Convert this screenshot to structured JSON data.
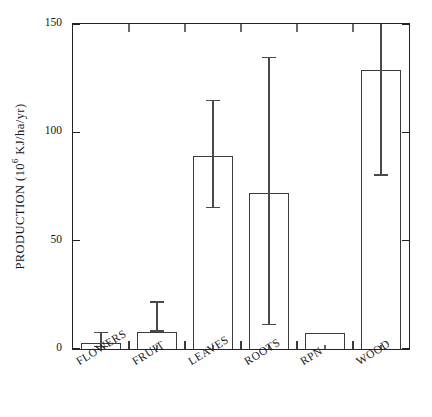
{
  "chart_data": {
    "type": "bar",
    "title": "",
    "xlabel": "",
    "ylabel": "PRODUCTION (10⁶ KJ/ha/yr)",
    "ylabel_parts": {
      "prefix": "PRODUCTION (10",
      "exponent": "6",
      "suffix": " KJ/ha/yr)"
    },
    "categories": [
      "FLOWERS",
      "FRUIT",
      "LEAVES",
      "ROOTS",
      "RPN",
      "WOOD"
    ],
    "values": [
      3,
      8,
      89,
      72,
      7.5,
      129
    ],
    "errors_low": [
      1,
      8,
      65,
      11,
      7.5,
      80
    ],
    "errors_high": [
      8,
      22,
      115,
      135,
      7.5,
      150
    ],
    "ylim": [
      0,
      150
    ],
    "yticks": [
      0,
      50,
      100,
      150
    ],
    "ytick_labels": [
      "0",
      "50",
      "100",
      "150"
    ],
    "grid": false,
    "legend": "none",
    "error_bar_notes": "WOOD upper whisker is clipped at the 150 axis maximum; RPN has no visible error bar."
  }
}
